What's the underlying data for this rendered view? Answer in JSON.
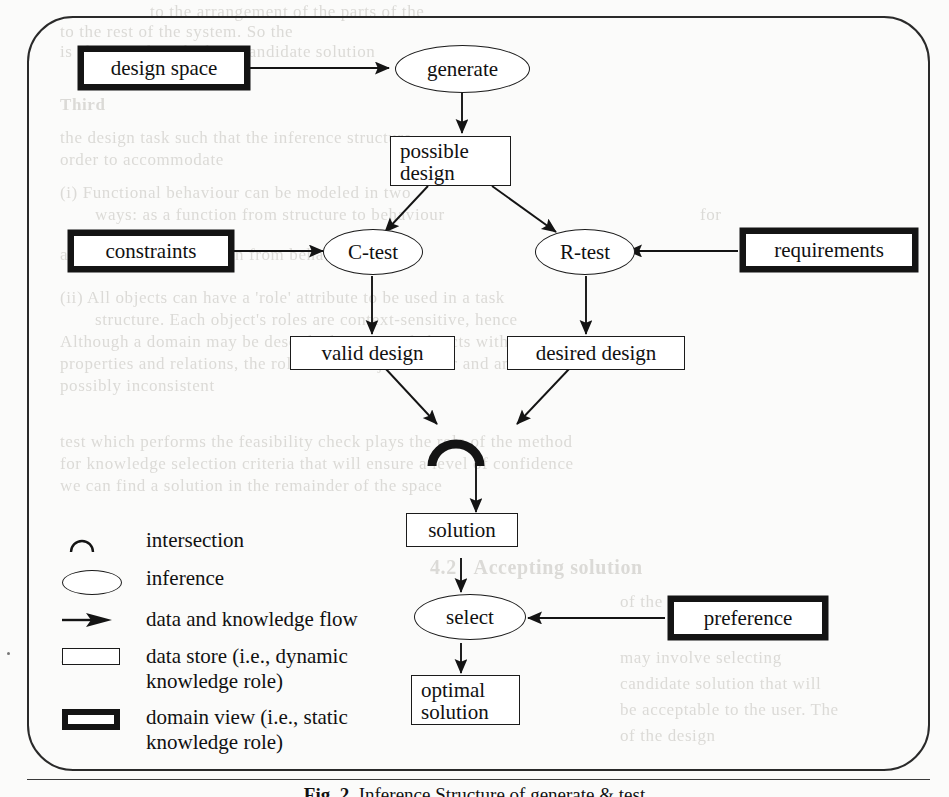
{
  "figure": {
    "caption_label": "Fig. 2.",
    "caption_text": "Inference Structure of generate & test"
  },
  "nodes": {
    "design_space": {
      "label": "design space",
      "kind": "domain-view"
    },
    "generate": {
      "label": "generate",
      "kind": "inference"
    },
    "possible_design": {
      "label": "possible\ndesign",
      "kind": "data-store"
    },
    "constraints": {
      "label": "constraints",
      "kind": "domain-view"
    },
    "c_test": {
      "label": "C-test",
      "kind": "inference"
    },
    "r_test": {
      "label": "R-test",
      "kind": "inference"
    },
    "requirements": {
      "label": "requirements",
      "kind": "domain-view"
    },
    "valid_design": {
      "label": "valid design",
      "kind": "data-store"
    },
    "desired_design": {
      "label": "desired design",
      "kind": "data-store"
    },
    "intersection": {
      "label": "",
      "kind": "intersection"
    },
    "solution": {
      "label": "solution",
      "kind": "data-store"
    },
    "select": {
      "label": "select",
      "kind": "inference"
    },
    "preference": {
      "label": "preference",
      "kind": "domain-view"
    },
    "optimal_solution": {
      "label": "optimal\nsolution",
      "kind": "data-store"
    }
  },
  "legend": {
    "items": [
      {
        "symbol": "intersection-arc-icon",
        "label": "intersection"
      },
      {
        "symbol": "ellipse-icon",
        "label": "inference"
      },
      {
        "symbol": "arrow-icon",
        "label": "data and knowledge flow"
      },
      {
        "symbol": "thin-rectangle-icon",
        "label": "data store (i.e., dynamic\nknowledge role)"
      },
      {
        "symbol": "thick-rectangle-icon",
        "label": "domain view (i.e., static\nknowledge role)"
      }
    ]
  },
  "flows": [
    {
      "from": "design space",
      "to": "generate"
    },
    {
      "from": "generate",
      "to": "possible design"
    },
    {
      "from": "possible design",
      "to": "C-test"
    },
    {
      "from": "possible design",
      "to": "R-test"
    },
    {
      "from": "constraints",
      "to": "C-test"
    },
    {
      "from": "requirements",
      "to": "R-test"
    },
    {
      "from": "C-test",
      "to": "valid design"
    },
    {
      "from": "R-test",
      "to": "desired design"
    },
    {
      "from": "valid design",
      "to": "intersection"
    },
    {
      "from": "desired design",
      "to": "intersection"
    },
    {
      "from": "intersection",
      "to": "solution"
    },
    {
      "from": "solution",
      "to": "select"
    },
    {
      "from": "preference",
      "to": "select"
    },
    {
      "from": "select",
      "to": "optimal solution"
    }
  ],
  "colors": {
    "ink": "#141414",
    "paper": "#fbfbfa",
    "ghost": "#c9c7c2"
  },
  "background_text": {
    "lines": [
      "to the",
      "in the",
      "to the",
      "is also to select",
      "Third",
      "the de",
      "order",
      "th",
      "(i)",
      "th",
      "e",
      "wo",
      "(ii)",
      "A",
      "test",
      "for",
      "we",
      "4.2",
      "Accepting solution"
    ]
  }
}
